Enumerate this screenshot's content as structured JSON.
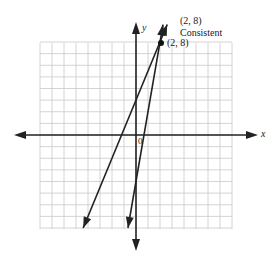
{
  "chart_data": {
    "type": "line",
    "title": "",
    "xlabel": "x",
    "ylabel": "y",
    "xlim": [
      -8,
      8
    ],
    "ylim": [
      -8,
      8
    ],
    "grid": true,
    "origin_label": "0",
    "series": [
      {
        "name": "Line 1",
        "equation": "y = 2.5x + 3",
        "points": [
          [
            -4.4,
            -8
          ],
          [
            2,
            8
          ],
          [
            2.6,
            9.5
          ]
        ]
      },
      {
        "name": "Line 2",
        "equation": "y = 6x - 4",
        "points": [
          [
            -0.67,
            -8
          ],
          [
            2,
            8
          ],
          [
            2.25,
            9.5
          ]
        ]
      }
    ],
    "annotations": [
      {
        "text": "(2, 8)",
        "x": 2,
        "y": 8,
        "type": "point-label"
      },
      {
        "text": "(2, 8)",
        "type": "summary-label"
      },
      {
        "text": "Consistent",
        "type": "summary-label"
      }
    ],
    "intersection": {
      "x": 2,
      "y": 8
    }
  },
  "labels": {
    "x_axis": "x",
    "y_axis": "y",
    "origin": "0",
    "point": "(2, 8)",
    "solution": "(2, 8)",
    "classification": "Consistent"
  }
}
